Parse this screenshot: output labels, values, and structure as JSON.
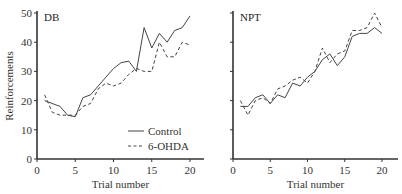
{
  "chart_data": [
    {
      "type": "line",
      "title": "DB",
      "xlabel": "Trial number",
      "ylabel": "Reinforcements",
      "xlim": [
        0,
        22
      ],
      "ylim": [
        0,
        50
      ],
      "xticks": [
        0,
        5,
        10,
        15,
        20
      ],
      "yticks": [
        0,
        10,
        20,
        30,
        40,
        50
      ],
      "grid": false,
      "legend_position": "lower right",
      "x": [
        1,
        2,
        3,
        4,
        5,
        6,
        7,
        8,
        9,
        10,
        11,
        12,
        13,
        14,
        15,
        16,
        17,
        18,
        19,
        20
      ],
      "series": [
        {
          "name": "Control",
          "style": "solid",
          "values": [
            20,
            19,
            18,
            15,
            14.5,
            21,
            22,
            25,
            28,
            31,
            33,
            33.5,
            30,
            45,
            38,
            43,
            40,
            44,
            45,
            49
          ]
        },
        {
          "name": "6-OHDA",
          "style": "dashed",
          "values": [
            22,
            16,
            15,
            15,
            15,
            18,
            19,
            24,
            26,
            25,
            26,
            29,
            31,
            30,
            30,
            40,
            35,
            35,
            40,
            39
          ]
        }
      ]
    },
    {
      "type": "line",
      "title": "NPT",
      "xlabel": "Trial number",
      "ylabel": "",
      "xlim": [
        0,
        22
      ],
      "ylim": [
        0,
        50
      ],
      "xticks": [
        0,
        5,
        10,
        15,
        20
      ],
      "yticks": [
        0,
        10,
        20,
        30,
        40,
        50
      ],
      "grid": false,
      "x": [
        1,
        2,
        3,
        4,
        5,
        6,
        7,
        8,
        9,
        10,
        11,
        12,
        13,
        14,
        15,
        16,
        17,
        18,
        19,
        20
      ],
      "series": [
        {
          "name": "Control",
          "style": "solid",
          "values": [
            18,
            18,
            21,
            22,
            19,
            22,
            21,
            26,
            25,
            28,
            30,
            34,
            36,
            32,
            35,
            42,
            43,
            43,
            45,
            43
          ]
        },
        {
          "name": "6-OHDA",
          "style": "dashed",
          "values": [
            20,
            15,
            20,
            21,
            19,
            24,
            25,
            27,
            28,
            26,
            30,
            38,
            33,
            36,
            37,
            44,
            44,
            45,
            50,
            45
          ]
        }
      ]
    }
  ],
  "legend": {
    "items": [
      {
        "label": "Control",
        "style": "solid"
      },
      {
        "label": "6-OHDA",
        "style": "dashed"
      }
    ]
  },
  "colors": {
    "line": "#444444",
    "axis": "#333333"
  }
}
